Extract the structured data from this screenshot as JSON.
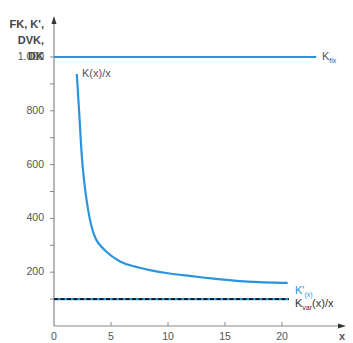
{
  "chart_data": {
    "type": "line",
    "title": "",
    "xlabel": "x",
    "ylabel": "FK, K', DVK, DK",
    "ylabel_lines": [
      "FK, K',",
      "DVK, DK"
    ],
    "xlim": [
      0,
      23.5
    ],
    "ylim": [
      0,
      1100
    ],
    "x_ticks": [
      0,
      5,
      10,
      15,
      20
    ],
    "x_tick_labels": [
      "0",
      "5",
      "10",
      "15",
      "20"
    ],
    "y_ticks": [
      100,
      200,
      300,
      400,
      500,
      600,
      700,
      800,
      900,
      1000
    ],
    "y_tick_labels": [
      "",
      "200",
      "",
      "400",
      "",
      "600",
      "",
      "800",
      "",
      "1.000"
    ],
    "grid": false,
    "legend_position": "inline-right",
    "series": [
      {
        "name": "K_fix",
        "label_main": "K",
        "label_sub": "fix",
        "color": "#2a94de",
        "style": "solid",
        "x": [
          0,
          23
        ],
        "y": [
          1000,
          1000
        ]
      },
      {
        "name": "K(x)/x",
        "label_main": "K(x)/x",
        "color": "#2a94de",
        "style": "solid",
        "x": [
          2.0,
          2.2,
          2.5,
          3.0,
          3.6,
          4.5,
          5.8,
          7.0,
          8.4,
          10.0,
          11.9,
          14.0,
          16.0,
          18.0,
          20.5
        ],
        "y": [
          937,
          800,
          600,
          430,
          330,
          280,
          240,
          222,
          208,
          196,
          186,
          176,
          168,
          163,
          160
        ]
      },
      {
        "name": "K'(x)",
        "label_main": "K'",
        "label_sub": "(x)",
        "color": "#2a94de",
        "style": "solid",
        "x": [
          0,
          20.6
        ],
        "y": [
          100,
          100
        ]
      },
      {
        "name": "K_var(x)/x",
        "label_main": "K",
        "label_sub": "var",
        "label_tail": "(x)/x",
        "color": "#111111",
        "style": "dashed",
        "x": [
          0,
          20.6
        ],
        "y": [
          100,
          100
        ]
      }
    ]
  },
  "axis_color": "#888888",
  "accent_color": "#2a94de"
}
